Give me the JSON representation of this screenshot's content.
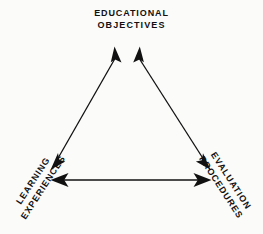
{
  "diagram": {
    "type": "triangle-relationship-diagram",
    "background_color": "#fbfbfa",
    "stroke_color": "#111111",
    "nodes": [
      {
        "id": "educational-objectives",
        "position": "top",
        "lines": [
          "EDUCATIONAL",
          "OBJECTIVES"
        ]
      },
      {
        "id": "learning-experiences",
        "position": "bottom-left",
        "lines": [
          "LEARNING",
          "EXPERIENCES"
        ]
      },
      {
        "id": "evaluation-procedures",
        "position": "bottom-right",
        "lines": [
          "EVALUATION",
          "PROCEDURES"
        ]
      }
    ],
    "edges": [
      {
        "id": "objectives-learning",
        "from": "educational-objectives",
        "to": "learning-experiences",
        "arrow": "double"
      },
      {
        "id": "objectives-evaluation",
        "from": "educational-objectives",
        "to": "evaluation-procedures",
        "arrow": "double"
      },
      {
        "id": "learning-evaluation",
        "from": "learning-experiences",
        "to": "evaluation-procedures",
        "arrow": "double"
      }
    ]
  }
}
